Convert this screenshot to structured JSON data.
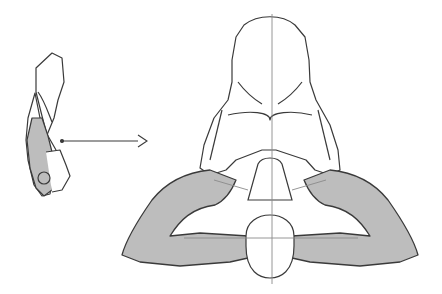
{
  "image": {
    "description": "Anatomical sketch: small side view of a figure with shaded arm at left, arrow pointing right to a large top-down view of a torso with arms folded behind head (shaded)",
    "colors": {
      "background": "#ffffff",
      "line": "#3a3a3a",
      "shade": "#bdbdbd",
      "guide": "#8a8a8a"
    }
  }
}
